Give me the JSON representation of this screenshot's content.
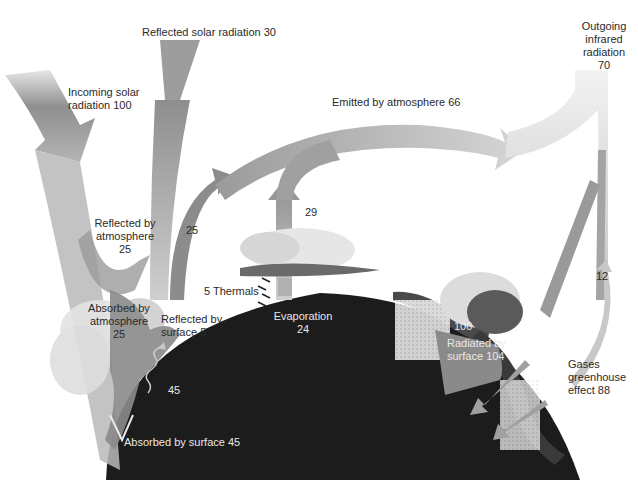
{
  "diagram": {
    "labels": {
      "reflected_solar": "Reflected solar radiation 30",
      "incoming_solar_1": "Incoming solar",
      "incoming_solar_2": "radiation 100",
      "emitted_atmosphere": "Emitted by atmosphere 66",
      "outgoing_ir_1": "Outgoing",
      "outgoing_ir_2": "infrared",
      "outgoing_ir_3": "radiation",
      "outgoing_ir_4": "70",
      "reflected_atm_1": "Reflected by",
      "reflected_atm_2": "atmosphere",
      "reflected_atm_3": "25",
      "latent_25": "25",
      "value_29": "29",
      "thermals": "5 Thermals",
      "absorbed_atm_1": "Absorbed by",
      "absorbed_atm_2": "atmosphere",
      "absorbed_atm_3": "25",
      "reflected_surface_1": "Reflected by",
      "reflected_surface_2": "surface 5",
      "evaporation_1": "Evaporation",
      "evaporation_2": "24",
      "value_45": "45",
      "absorbed_surface": "Absorbed by surface 45",
      "value_100": "100",
      "radiated_surface_1": "Radiated by",
      "radiated_surface_2": "surface 104",
      "value_12": "12",
      "greenhouse_1": "Gases",
      "greenhouse_2": "greenhouse",
      "greenhouse_3": "effect 88"
    },
    "colors": {
      "earth": "#1c1c1c",
      "arrow_light": "#d4d4d4",
      "arrow_mid": "#a8a8a8",
      "arrow_dark": "#8a8a8a",
      "cloud_light": "#e2e2e2",
      "cloud_dark": "#4a4a4a"
    }
  }
}
